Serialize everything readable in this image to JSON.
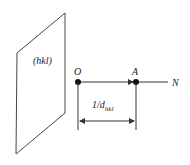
{
  "diagram": {
    "plane_label": "(hkl)",
    "origin_label": "O",
    "point_a_label": "A",
    "normal_label": "N",
    "distance_label_prefix": "1/d",
    "distance_label_subscript": "hkl",
    "colors": {
      "stroke": "#333333",
      "text": "#222222",
      "background": "#ffffff"
    }
  }
}
